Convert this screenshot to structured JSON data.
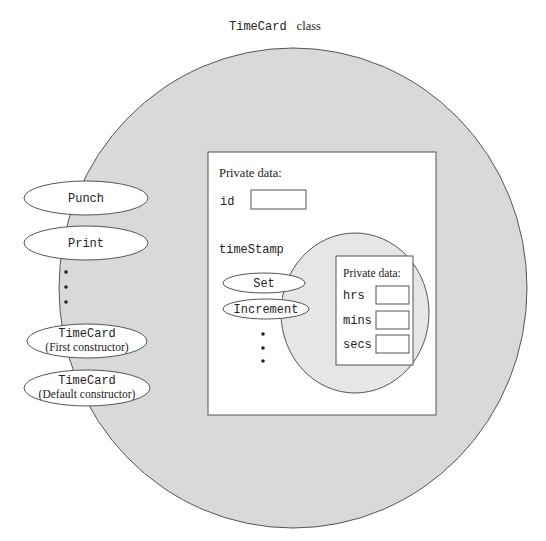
{
  "title": {
    "class_name": "TimeCard",
    "suffix": "class"
  },
  "colors": {
    "outer_fill": "#d9d9d9",
    "inner_circle_fill": "#e6e6e6",
    "stroke": "#555555",
    "box_fill": "#ffffff"
  },
  "public_operations": [
    {
      "name": "Punch",
      "sub": ""
    },
    {
      "name": "Print",
      "sub": ""
    },
    {
      "name": "TimeCard",
      "sub": "(First constructor)"
    },
    {
      "name": "TimeCard",
      "sub": "(Default constructor)"
    }
  ],
  "outer_private": {
    "heading": "Private data:",
    "fields": [
      {
        "label": "id"
      },
      {
        "label": "timeStamp"
      }
    ]
  },
  "timestamp_operations": [
    {
      "name": "Set"
    },
    {
      "name": "Increment"
    }
  ],
  "inner_private": {
    "heading": "Private data:",
    "fields": [
      {
        "label": "hrs"
      },
      {
        "label": "mins"
      },
      {
        "label": "secs"
      }
    ]
  }
}
